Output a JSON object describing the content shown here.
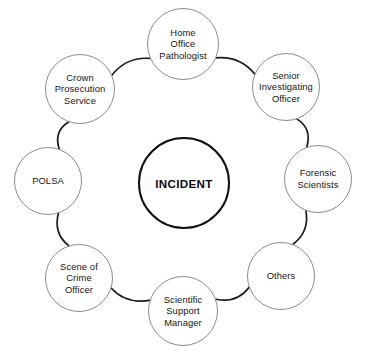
{
  "diagram": {
    "title": "INCIDENT",
    "type": "ring-network",
    "center": {
      "label": "INCIDENT",
      "cx": 184,
      "cy": 183,
      "r": 46,
      "bold": true,
      "stroke_color": "#111111"
    },
    "style": {
      "background_color": "#ffffff",
      "node_stroke_color": "#8b8b8b",
      "connector_color": "#1b1b1b",
      "text_color": "#141414"
    },
    "nodes": [
      {
        "id": "home-office-pathologist",
        "label": "Home\nOffice\nPathologist",
        "cx": 183,
        "cy": 44,
        "r": 36
      },
      {
        "id": "senior-investigating-officer",
        "label": "Senior\nInvestigating\nOfficer",
        "cx": 286,
        "cy": 87,
        "r": 34
      },
      {
        "id": "forensic-scientists",
        "label": "Forensic\nScientists",
        "cx": 318,
        "cy": 179,
        "r": 34
      },
      {
        "id": "others",
        "label": "Others",
        "cx": 281,
        "cy": 276,
        "r": 34
      },
      {
        "id": "scientific-support-manager",
        "label": "Scientific\nSupport\nManager",
        "cx": 183,
        "cy": 311,
        "r": 35
      },
      {
        "id": "scene-of-crime-officer",
        "label": "Scene of\nCrime\nOfficer",
        "cx": 79,
        "cy": 278,
        "r": 34
      },
      {
        "id": "polsa",
        "label": "POLSA",
        "cx": 48,
        "cy": 181,
        "r": 34
      },
      {
        "id": "crown-prosecution-service",
        "label": "Crown\nProsecution\nService",
        "cx": 80,
        "cy": 89,
        "r": 35
      }
    ],
    "connections": [
      {
        "from": "home-office-pathologist",
        "to": "senior-investigating-officer"
      },
      {
        "from": "senior-investigating-officer",
        "to": "forensic-scientists"
      },
      {
        "from": "forensic-scientists",
        "to": "others"
      },
      {
        "from": "others",
        "to": "scientific-support-manager"
      },
      {
        "from": "scientific-support-manager",
        "to": "scene-of-crime-officer"
      },
      {
        "from": "scene-of-crime-officer",
        "to": "polsa"
      },
      {
        "from": "polsa",
        "to": "crown-prosecution-service"
      },
      {
        "from": "crown-prosecution-service",
        "to": "home-office-pathologist"
      }
    ]
  }
}
